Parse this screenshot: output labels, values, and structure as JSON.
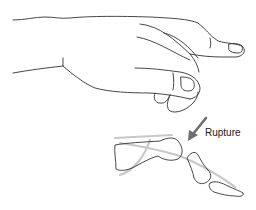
{
  "figure": {
    "title": "",
    "labels": {
      "rupture": "Rupture"
    },
    "colors": {
      "outline": "#333333",
      "tendon": "#c8c8c8",
      "arrow": "#6e6e6e",
      "background": "#ffffff"
    }
  }
}
